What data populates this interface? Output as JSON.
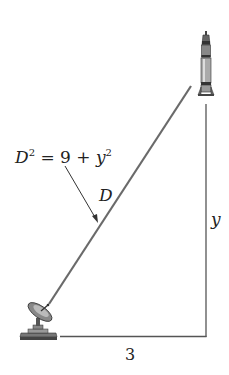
{
  "diagram": {
    "equation": {
      "D": "D",
      "sup1": "2",
      "equals": " = 9 + ",
      "y": "y",
      "sup2": "2"
    },
    "hypotenuse_label": "D",
    "vertical_label": "y",
    "horizontal_label": "3",
    "objects": {
      "top": "rocket",
      "bottom_left": "satellite-dish"
    },
    "colors": {
      "line": "#555555",
      "diagonal": "#6a6a6a",
      "text": "#222222"
    }
  }
}
